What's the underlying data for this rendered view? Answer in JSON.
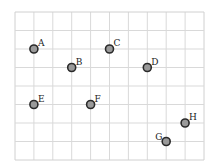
{
  "diagram": {
    "type": "grid-points",
    "grid": {
      "x0": 15,
      "y0": 12,
      "cols": 10,
      "rows": 8,
      "cell_w": 18.9,
      "cell_h": 18.5,
      "line_color": "#d9d9d9",
      "border_color": "#d0d0d0"
    },
    "point_style": {
      "fill": "#9a9a9a",
      "stroke": "#2a2a2a",
      "radius": 4
    },
    "points": [
      {
        "label": "A",
        "col": 1,
        "row": 2,
        "label_pos": "upper-right"
      },
      {
        "label": "B",
        "col": 3,
        "row": 3,
        "label_pos": "upper-right"
      },
      {
        "label": "C",
        "col": 5,
        "row": 2,
        "label_pos": "upper-right"
      },
      {
        "label": "D",
        "col": 7,
        "row": 3,
        "label_pos": "upper-right"
      },
      {
        "label": "E",
        "col": 1,
        "row": 5,
        "label_pos": "upper-right"
      },
      {
        "label": "F",
        "col": 4,
        "row": 5,
        "label_pos": "upper-right"
      },
      {
        "label": "G",
        "col": 8,
        "row": 7,
        "label_pos": "upper-left"
      },
      {
        "label": "H",
        "col": 9,
        "row": 6,
        "label_pos": "upper-right"
      }
    ]
  }
}
